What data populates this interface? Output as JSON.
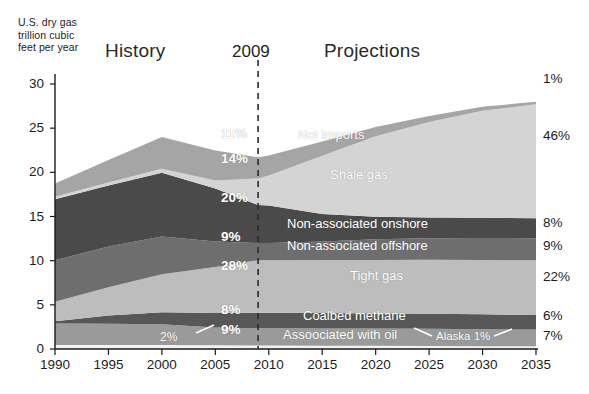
{
  "chart_data": {
    "type": "area",
    "title": "U.S. dry gas\ntrillion cubic\nfeet per year",
    "xlabel": "",
    "ylabel": "",
    "xlim": [
      1990,
      2035
    ],
    "ylim": [
      0,
      30
    ],
    "grid": false,
    "legend_position": "inline-band-labels",
    "x": [
      1990,
      1995,
      2000,
      2005,
      2009,
      2010,
      2015,
      2020,
      2025,
      2030,
      2035
    ],
    "xticks": [
      "1990",
      "1995",
      "2000",
      "2005",
      "2010",
      "2015",
      "2020",
      "2025",
      "2030",
      "2035"
    ],
    "yticks": [
      "0",
      "5",
      "10",
      "15",
      "20",
      "25",
      "30"
    ],
    "era_divider_year": 2009,
    "era_divider_label": "2009",
    "era_left_label": "History",
    "era_right_label": "Projections",
    "stack_order_bottom_to_top": [
      "Alaska",
      "Associated with oil",
      "Coalbed methane",
      "Tight gas",
      "Non-associated offshore",
      "Non-associated onshore",
      "Shale gas",
      "Net imports"
    ],
    "series": [
      {
        "name": "Alaska",
        "label": "Alaska",
        "color": "#f2f2f2",
        "share_2009": "2%",
        "share_2035": "1%",
        "values": [
          0.45,
          0.45,
          0.45,
          0.42,
          0.4,
          0.4,
          0.38,
          0.36,
          0.34,
          0.32,
          0.3
        ]
      },
      {
        "name": "Associated with oil",
        "label": "Assoociated with oil",
        "color": "#9a9a9a",
        "share_2009": "9%",
        "share_2035": "7%",
        "values": [
          2.45,
          2.4,
          2.35,
          2.0,
          1.95,
          1.95,
          1.95,
          1.95,
          1.95,
          1.92,
          1.9
        ]
      },
      {
        "name": "Coalbed methane",
        "label": "Coalbed methane",
        "color": "#575757",
        "share_2009": "8%",
        "share_2035": "6%",
        "values": [
          0.25,
          0.95,
          1.35,
          1.65,
          1.75,
          1.75,
          1.75,
          1.72,
          1.7,
          1.68,
          1.65
        ]
      },
      {
        "name": "Tight gas",
        "label": "Tight gas",
        "color": "#bdbdbd",
        "share_2009": "28%",
        "share_2035": "22%",
        "values": [
          2.2,
          3.2,
          4.3,
          5.2,
          5.95,
          5.95,
          6.0,
          6.05,
          6.1,
          6.15,
          6.2
        ]
      },
      {
        "name": "Non-associated offshore",
        "label": "Non-associated offshore",
        "color": "#6e6e6e",
        "share_2009": "9%",
        "share_2035": "9%",
        "values": [
          4.7,
          4.6,
          4.3,
          2.9,
          1.95,
          1.95,
          2.1,
          2.35,
          2.45,
          2.5,
          2.5
        ]
      },
      {
        "name": "Non-associated onshore",
        "label": "Non-associated onshore",
        "color": "#4a4a4a",
        "share_2009": "20%",
        "share_2035": "8%",
        "values": [
          6.9,
          6.9,
          7.2,
          6.0,
          4.3,
          4.25,
          3.1,
          2.55,
          2.35,
          2.3,
          2.25
        ]
      },
      {
        "name": "Shale gas",
        "label": "Shale gas",
        "color": "#d4d4d4",
        "share_2009": "14%",
        "share_2035": "46%",
        "values": [
          0.3,
          0.35,
          0.45,
          0.9,
          3.0,
          3.4,
          6.6,
          9.1,
          10.8,
          12.1,
          12.9
        ]
      },
      {
        "name": "Net imports",
        "label": "Net imports",
        "color": "#a5a5a5",
        "share_2009": "11%",
        "share_2035": "1%",
        "values": [
          1.5,
          2.55,
          3.6,
          3.4,
          2.4,
          2.25,
          1.6,
          1.05,
          0.7,
          0.45,
          0.3
        ]
      }
    ],
    "right_side_percentages": [
      "1%",
      "46%",
      "8%",
      "9%",
      "22%",
      "6%",
      "7%"
    ],
    "inner_percentages": [
      "11%",
      "14%",
      "20%",
      "9%",
      "28%",
      "8%",
      "9%"
    ],
    "annotations": [
      {
        "text": "2%",
        "target": "Alaska band (history)"
      },
      {
        "text": "Alaska 1%",
        "target": "Alaska band (projections)"
      }
    ]
  }
}
